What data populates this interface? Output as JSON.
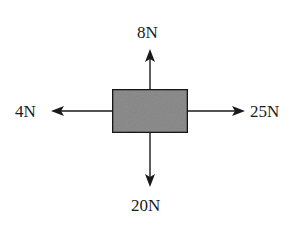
{
  "diagram": {
    "type": "free-body-diagram",
    "object": {
      "shape": "rectangle",
      "fill": "#8f8f8f",
      "stroke": "#1a1a1a"
    },
    "forces": {
      "up": {
        "label": "8N",
        "magnitude": 8,
        "unit": "N",
        "direction": "up"
      },
      "down": {
        "label": "20N",
        "magnitude": 20,
        "unit": "N",
        "direction": "down"
      },
      "left": {
        "label": "4N",
        "magnitude": 4,
        "unit": "N",
        "direction": "left"
      },
      "right": {
        "label": "25N",
        "magnitude": 25,
        "unit": "N",
        "direction": "right"
      }
    },
    "colors": {
      "arrow": "#1a1a1a",
      "box_fill": "#8f8f8f",
      "background": "#ffffff"
    }
  }
}
